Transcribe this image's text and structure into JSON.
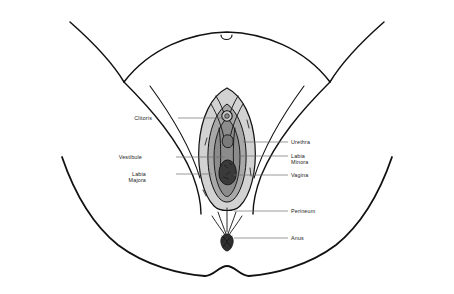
{
  "diagram": {
    "view": "anterior-inferior view of perineum between thighs",
    "background_color": "#ffffff",
    "line_color": "#111111",
    "leader_line_color": "#6e6e6e",
    "label_text_color": "#1b1b1b",
    "shading": {
      "labia_majora_fill": "#d2d2d2",
      "labia_minora_fill": "#a8a8a8",
      "vestibule_fill": "#8c8c8c",
      "vaginal_opening_fill": "#3a3a3a",
      "clitoris_fill": "#c9c9c9",
      "anus_fill": "#2f2f2f"
    },
    "labels": [
      {
        "id": "clitoris",
        "text": "Clitoris",
        "lines": [
          "Clitoris"
        ],
        "side": "left",
        "text_x": 152,
        "text_y": 115,
        "leader_from_x": 178,
        "leader_from_y": 118,
        "leader_to_x": 228,
        "leader_to_y": 118
      },
      {
        "id": "vestibule",
        "text": "Vestibule",
        "lines": [
          "Vestibule"
        ],
        "side": "left",
        "text_x": 142,
        "text_y": 154,
        "leader_from_x": 176,
        "leader_from_y": 157,
        "leader_to_x": 225,
        "leader_to_y": 157
      },
      {
        "id": "labia-majora",
        "text": "Labia Majora",
        "lines": [
          "Labia",
          "Majora"
        ],
        "side": "left",
        "text_x": 146,
        "text_y": 171,
        "leader_from_x": 176,
        "leader_from_y": 174,
        "leader_to_x": 212,
        "leader_to_y": 174
      },
      {
        "id": "urethra",
        "text": "Urethra",
        "lines": [
          "Urethra"
        ],
        "side": "right",
        "text_x": 291,
        "text_y": 139,
        "leader_from_x": 243,
        "leader_from_y": 142,
        "leader_to_x": 288,
        "leader_to_y": 142
      },
      {
        "id": "labia-minora",
        "text": "Labia Minora",
        "lines": [
          "Labia",
          "Minora"
        ],
        "side": "right",
        "text_x": 291,
        "text_y": 153,
        "leader_from_x": 238,
        "leader_from_y": 156,
        "leader_to_x": 288,
        "leader_to_y": 156
      },
      {
        "id": "vagina",
        "text": "Vagina",
        "lines": [
          "Vagina"
        ],
        "side": "right",
        "text_x": 291,
        "text_y": 172,
        "leader_from_x": 234,
        "leader_from_y": 175,
        "leader_to_x": 288,
        "leader_to_y": 175
      },
      {
        "id": "perineum",
        "text": "Perineum",
        "lines": [
          "Perineum"
        ],
        "side": "right",
        "text_x": 291,
        "text_y": 208,
        "leader_from_x": 234,
        "leader_from_y": 211,
        "leader_to_x": 288,
        "leader_to_y": 211
      },
      {
        "id": "anus",
        "text": "Anus",
        "lines": [
          "Anus"
        ],
        "side": "right",
        "text_x": 291,
        "text_y": 235,
        "leader_from_x": 234,
        "leader_from_y": 238,
        "leader_to_x": 288,
        "leader_to_y": 238
      }
    ],
    "structures": [
      "mons pubis",
      "left thigh",
      "right thigh",
      "labia majora",
      "labia minora",
      "vestibule",
      "clitoris",
      "urethral opening",
      "vaginal opening",
      "perineum",
      "anus",
      "gluteal fold"
    ]
  }
}
